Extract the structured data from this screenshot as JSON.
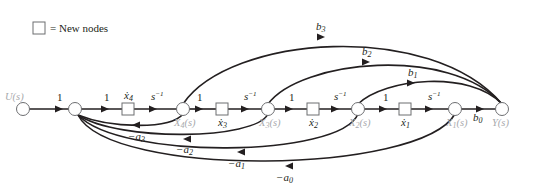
{
  "legend": {
    "symbol": "square",
    "text": "= New nodes"
  },
  "nodes": [
    {
      "id": "U",
      "label": "U(s)",
      "type": "circle"
    },
    {
      "id": "sum",
      "label": "",
      "type": "circle"
    },
    {
      "id": "x4dot",
      "label": "ẋ4",
      "type": "square"
    },
    {
      "id": "X4",
      "label": "X4(s)",
      "type": "circle"
    },
    {
      "id": "x3dot",
      "label": "ẋ3",
      "type": "square"
    },
    {
      "id": "X3",
      "label": "X3(s)",
      "type": "circle"
    },
    {
      "id": "x2dot",
      "label": "ẋ2",
      "type": "square"
    },
    {
      "id": "X2",
      "label": "X2(s)",
      "type": "circle"
    },
    {
      "id": "x1dot",
      "label": "ẋ1",
      "type": "square"
    },
    {
      "id": "X1",
      "label": "X1(s)",
      "type": "circle"
    },
    {
      "id": "Y",
      "label": "Y(s)",
      "type": "circle"
    }
  ],
  "forward_gains": {
    "u_to_sum": "1",
    "sum_to_x4dot": "1",
    "x4dot_to_X4": "s⁻¹",
    "X4_to_x3dot": "1",
    "x3dot_to_X3": "s⁻¹",
    "X3_to_x2dot": "1",
    "x2dot_to_X2": "s⁻¹",
    "X2_to_x1dot": "1",
    "x1dot_to_X1": "s⁻¹",
    "X1_to_Y": "b0"
  },
  "feedforward": [
    {
      "from": "X4",
      "to": "Y",
      "gain": "b3"
    },
    {
      "from": "X3",
      "to": "Y",
      "gain": "b2"
    },
    {
      "from": "X2",
      "to": "Y",
      "gain": "b1"
    }
  ],
  "feedback": [
    {
      "from": "X4",
      "to": "sum",
      "gain": "−a3"
    },
    {
      "from": "X3",
      "to": "sum",
      "gain": "−a2"
    },
    {
      "from": "X2",
      "to": "sum",
      "gain": "−a1"
    },
    {
      "from": "X1",
      "to": "sum",
      "gain": "−a0"
    }
  ],
  "labels": {
    "U": "U",
    "X": "X",
    "Y": "Y",
    "s": "(s)",
    "one": "1",
    "sinv": "s",
    "sup": "−1",
    "b": "b",
    "a": "−a",
    "i0": "0",
    "i1": "1",
    "i2": "2",
    "i3": "3",
    "i4": "4"
  }
}
